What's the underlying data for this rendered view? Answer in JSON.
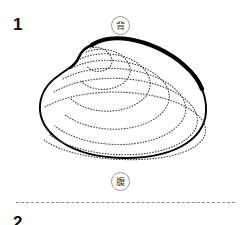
{
  "figure": {
    "number_label": "1",
    "next_number_label": "2",
    "caption": ""
  },
  "orientation_markers": {
    "dorsal": {
      "glyph": "背",
      "meaning": "dorsal",
      "position": "top",
      "icon_name": "circled-character-dorsal"
    },
    "ventral": {
      "glyph": "腹",
      "meaning": "ventral",
      "position": "bottom",
      "icon_name": "circled-character-ventral"
    }
  },
  "illustration": {
    "name": "clam-shell-outline",
    "style": "line-drawing",
    "outline_color": "#000000",
    "growth_ring_color": "#555555",
    "fill_color": "#ffffff",
    "growth_ring_count": 7,
    "umbo_position": "upper-left"
  },
  "divider": {
    "style": "dashed",
    "color": "#8d8d8d"
  },
  "colors": {
    "background": "#ffffff",
    "ink": "#0a0a0a",
    "marker_stroke": "#9a9a9a"
  }
}
